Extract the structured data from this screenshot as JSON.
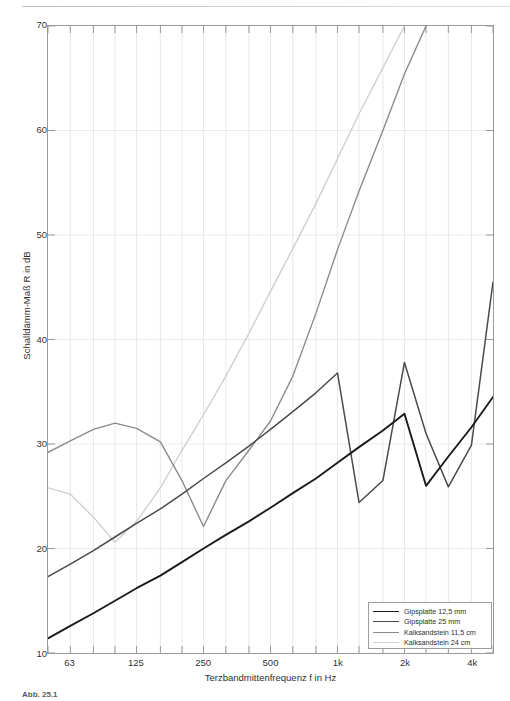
{
  "figure": {
    "x_axis": {
      "title": "Terzbandmittenfrequenz f in Hz",
      "tick_labels": [
        "63",
        "125",
        "250",
        "500",
        "1k",
        "2k",
        "4k"
      ],
      "tick_values": [
        63,
        125,
        250,
        500,
        1000,
        2000,
        4000
      ],
      "range_hz": [
        50,
        5000
      ],
      "scale": "log"
    },
    "y_axis": {
      "title": "Schalldämm-Maß R in dB",
      "tick_labels": [
        "10",
        "20",
        "30",
        "40",
        "50",
        "60",
        "70"
      ],
      "tick_values": [
        10,
        20,
        30,
        40,
        50,
        60,
        70
      ],
      "range_db": [
        10,
        70
      ]
    },
    "legend": {
      "items": [
        {
          "label": "Gipsplatte 12,5 mm",
          "color": "#1a1a1a",
          "width": 1.9
        },
        {
          "label": "Gipsplatte 25 mm",
          "color": "#4a4a4a",
          "width": 1.5
        },
        {
          "label": "Kalksandstein 11,5 cm",
          "color": "#8b8b8b",
          "width": 1.4
        },
        {
          "label": "Kalksandstein 24 cm",
          "color": "#cfcfcf",
          "width": 1.4
        }
      ]
    },
    "caption": "Abb. 25.1"
  },
  "chart_data": {
    "type": "line",
    "title": "",
    "xlabel": "Terzbandmittenfrequenz f in Hz",
    "ylabel": "Schalldämm-Maß R in dB",
    "xscale": "log",
    "xlim": [
      50,
      5000
    ],
    "ylim": [
      10,
      70
    ],
    "grid": true,
    "legend_position": "lower-right",
    "x": [
      50,
      63,
      80,
      100,
      125,
      160,
      200,
      250,
      315,
      400,
      500,
      630,
      800,
      1000,
      1250,
      1600,
      2000,
      2500,
      3150,
      4000,
      5000
    ],
    "series": [
      {
        "name": "Gipsplatte 12,5 mm",
        "color": "#1a1a1a",
        "values": [
          11.4,
          12.6,
          13.8,
          15.0,
          16.2,
          17.4,
          18.7,
          20.0,
          21.3,
          22.6,
          23.9,
          25.3,
          26.7,
          28.2,
          29.7,
          31.3,
          32.9,
          26.0,
          28.8,
          31.6,
          34.5
        ]
      },
      {
        "name": "Gipsplatte 25 mm",
        "color": "#4a4a4a",
        "values": [
          17.3,
          18.5,
          19.8,
          21.1,
          22.4,
          23.8,
          25.2,
          26.7,
          28.2,
          29.8,
          31.4,
          33.1,
          34.9,
          36.8,
          24.4,
          26.5,
          37.8,
          31.0,
          25.9,
          29.9,
          45.5
        ]
      },
      {
        "name": "Kalksandstein 11,5 cm",
        "color": "#8b8b8b",
        "values": [
          29.2,
          30.3,
          31.4,
          32.0,
          31.5,
          30.2,
          26.5,
          22.1,
          26.5,
          29.4,
          32.2,
          36.5,
          42.5,
          48.6,
          54.2,
          60.0,
          65.4,
          70.0,
          null,
          null,
          null
        ]
      },
      {
        "name": "Kalksandstein 24 cm",
        "color": "#cfcfcf",
        "values": [
          25.8,
          25.2,
          23.0,
          20.6,
          22.6,
          25.8,
          29.4,
          32.8,
          36.5,
          40.6,
          44.6,
          48.7,
          53.0,
          57.3,
          61.6,
          66.0,
          70.0,
          null,
          null,
          null,
          null
        ]
      }
    ]
  }
}
